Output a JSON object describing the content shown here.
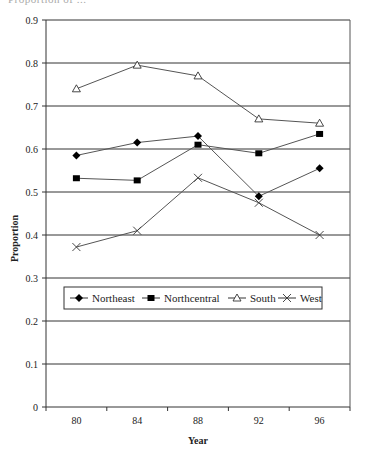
{
  "header": {
    "cut_text": "Proportion of ..."
  },
  "chart_data": {
    "type": "line",
    "title": "",
    "xlabel": "Year",
    "ylabel": "Proportion",
    "categories": [
      "80",
      "84",
      "88",
      "92",
      "96"
    ],
    "ylim": [
      0,
      0.9
    ],
    "yticks": [
      "0",
      "0.1",
      "0.2",
      "0.3",
      "0.4",
      "0.5",
      "0.6",
      "0.7",
      "0.8",
      "0.9"
    ],
    "grid": true,
    "legend_position": "inside-lower",
    "series": [
      {
        "name": "Northeast",
        "marker": "diamond",
        "values": [
          0.585,
          0.615,
          0.63,
          0.49,
          0.555
        ]
      },
      {
        "name": "Northcentral",
        "marker": "square",
        "values": [
          0.532,
          0.527,
          0.61,
          0.59,
          0.635
        ]
      },
      {
        "name": "South",
        "marker": "triangle-open",
        "values": [
          0.74,
          0.795,
          0.77,
          0.67,
          0.66
        ]
      },
      {
        "name": "West",
        "marker": "x",
        "values": [
          0.372,
          0.41,
          0.533,
          0.475,
          0.4
        ]
      }
    ]
  },
  "colors": {
    "line": "#555555",
    "grid": "#333333",
    "marker": "#000000"
  }
}
